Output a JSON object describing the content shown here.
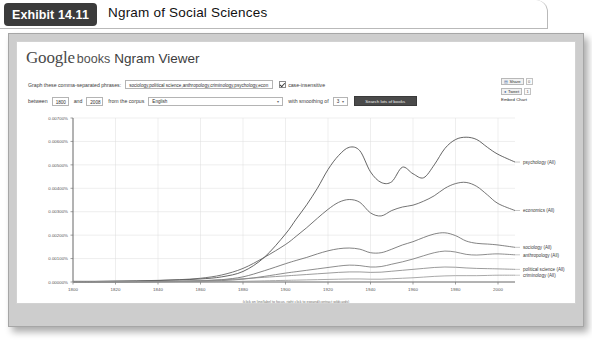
{
  "exhibit": {
    "tab_label": "Exhibit 14.11",
    "title": "Ngram of Social Sciences"
  },
  "masthead": {
    "google": "Google",
    "books": "books",
    "product": "Ngram Viewer"
  },
  "form": {
    "phrases_label": "Graph these comma-separated phrases:",
    "phrases_value": "sociology,political science,anthropology,criminology,psychology,econ",
    "case_insensitive_label": "case-insensitive",
    "case_insensitive_checked": true,
    "between_label": "between",
    "year_start": "1800",
    "and_label": "and",
    "year_end": "2008",
    "corpus_label": "from the corpus",
    "corpus_value": "English",
    "smoothing_label": "with smoothing of",
    "smoothing_value": "3",
    "search_button_label": "Search lots of books"
  },
  "share": {
    "share_label": "Share",
    "share_count": "0",
    "tweet_label": "Tweet",
    "tweet_count": "1",
    "embed_label": "Embed Chart"
  },
  "chart_footnote": "(click on line/label to focus, right click to expand/contract wildcards)",
  "chart_data": {
    "type": "line",
    "title": "",
    "xlabel": "",
    "ylabel": "",
    "xlim": [
      1800,
      2008
    ],
    "ylim": [
      0,
      0.007
    ],
    "grid": true,
    "legend_position": "right-inline-labels",
    "xticks": [
      1800,
      1820,
      1840,
      1860,
      1880,
      1900,
      1920,
      1940,
      1960,
      1980,
      2000
    ],
    "yticks": [
      "0.00000%",
      "0.00100%",
      "0.00200%",
      "0.00300%",
      "0.00400%",
      "0.00500%",
      "0.00600%",
      "0.00700%"
    ],
    "ytick_values": [
      0.0,
      0.001,
      0.002,
      0.003,
      0.004,
      0.005,
      0.006,
      0.007
    ],
    "x": [
      1800,
      1810,
      1820,
      1830,
      1840,
      1850,
      1860,
      1870,
      1880,
      1890,
      1900,
      1905,
      1910,
      1915,
      1920,
      1925,
      1930,
      1935,
      1940,
      1945,
      1950,
      1955,
      1960,
      1965,
      1970,
      1975,
      1980,
      1985,
      1990,
      1995,
      2000,
      2008
    ],
    "series": [
      {
        "name": "psychology (All)",
        "label": "psychology (All)",
        "color": "#4a4a4a",
        "values": [
          2e-05,
          2e-05,
          3e-05,
          4e-05,
          6e-05,
          9e-05,
          0.00013,
          0.00022,
          0.00045,
          0.00105,
          0.00205,
          0.00268,
          0.0033,
          0.004,
          0.0048,
          0.0054,
          0.00575,
          0.0056,
          0.0047,
          0.00425,
          0.00428,
          0.0049,
          0.00462,
          0.00445,
          0.005,
          0.0057,
          0.00608,
          0.00618,
          0.00608,
          0.00575,
          0.00545,
          0.00512
        ]
      },
      {
        "name": "economics (All)",
        "label": "economics (All)",
        "color": "#5c5c5c",
        "values": [
          3e-05,
          3e-05,
          4e-05,
          5e-05,
          7e-05,
          0.0001,
          0.00016,
          0.0003,
          0.00058,
          0.00105,
          0.0016,
          0.00195,
          0.00232,
          0.00272,
          0.0031,
          0.0034,
          0.00352,
          0.0034,
          0.00295,
          0.00282,
          0.00305,
          0.0032,
          0.00328,
          0.00345,
          0.00368,
          0.004,
          0.0042,
          0.00425,
          0.00408,
          0.00372,
          0.00335,
          0.00305
        ]
      },
      {
        "name": "sociology (All)",
        "label": "sociology (All)",
        "color": "#6d6d6d",
        "values": [
          0.0,
          0.0,
          1e-05,
          1e-05,
          2e-05,
          3e-05,
          5e-05,
          0.0001,
          0.00022,
          0.00048,
          0.00078,
          0.00092,
          0.00105,
          0.0012,
          0.00133,
          0.00142,
          0.00145,
          0.0014,
          0.00125,
          0.00125,
          0.0014,
          0.00158,
          0.00172,
          0.0019,
          0.00205,
          0.0021,
          0.00198,
          0.00175,
          0.00165,
          0.00162,
          0.00158,
          0.00148
        ]
      },
      {
        "name": "anthropology (All)",
        "label": "anthropology (All)",
        "color": "#7a7a7a",
        "values": [
          0.0,
          0.0,
          0.0,
          1e-05,
          1e-05,
          2e-05,
          3e-05,
          6e-05,
          0.00012,
          0.00024,
          0.00038,
          0.00044,
          0.0005,
          0.00056,
          0.00062,
          0.00068,
          0.00072,
          0.0007,
          0.00064,
          0.00066,
          0.00076,
          0.00086,
          0.00098,
          0.00112,
          0.00125,
          0.00132,
          0.00128,
          0.00118,
          0.00115,
          0.00118,
          0.0012,
          0.00116
        ]
      },
      {
        "name": "political science (All)",
        "label": "political science (All)",
        "color": "#8a8a8a",
        "values": [
          1e-05,
          1e-05,
          2e-05,
          2e-05,
          3e-05,
          4e-05,
          6e-05,
          9e-05,
          0.00014,
          0.0002,
          0.00026,
          0.00029,
          0.00032,
          0.00035,
          0.00038,
          0.00041,
          0.00043,
          0.00043,
          0.00041,
          0.00042,
          0.00046,
          0.0005,
          0.00054,
          0.00058,
          0.00062,
          0.00064,
          0.00063,
          0.0006,
          0.00058,
          0.00057,
          0.00056,
          0.00054
        ]
      },
      {
        "name": "criminology (All)",
        "label": "criminology (All)",
        "color": "#9a9a9a",
        "values": [
          0.0,
          0.0,
          0.0,
          0.0,
          0.0,
          1e-05,
          1e-05,
          2e-05,
          3e-05,
          5e-05,
          7e-05,
          8e-05,
          9e-05,
          0.0001,
          0.00011,
          0.00012,
          0.00013,
          0.00013,
          0.00012,
          0.00012,
          0.00014,
          0.00016,
          0.00018,
          0.00021,
          0.00024,
          0.00026,
          0.00027,
          0.00027,
          0.00027,
          0.00028,
          0.00029,
          0.00029
        ]
      }
    ]
  }
}
